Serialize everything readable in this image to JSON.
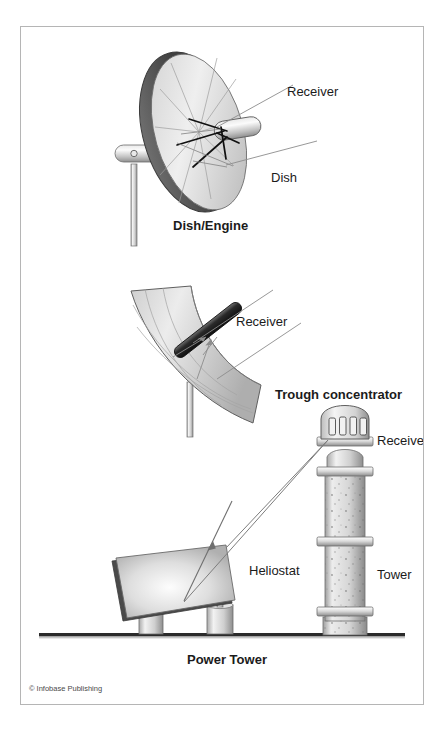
{
  "figure": {
    "copyright": "© Infobase Publishing",
    "colors": {
      "frame_border": "#b5b5b5",
      "background": "#ffffff",
      "text": "#1b1b1b",
      "ray_line": "#8c8c8c",
      "dark_line": "#111111",
      "ground": "#2b2b2b",
      "metal_light": "#f0f0f0",
      "metal_mid": "#b9b9b9",
      "metal_dark": "#6b6b6b",
      "rim_dark": "#4d4d4d"
    }
  },
  "panels": [
    {
      "id": "dish-engine",
      "caption": "Dish/Engine",
      "labels": [
        {
          "id": "receiver",
          "text": "Receiver"
        },
        {
          "id": "dish",
          "text": "Dish"
        }
      ]
    },
    {
      "id": "trough",
      "caption": "Trough concentrator",
      "labels": [
        {
          "id": "receiver",
          "text": "Receiver"
        }
      ]
    },
    {
      "id": "power-tower",
      "caption": "Power Tower",
      "labels": [
        {
          "id": "receiver",
          "text": "Receiver"
        },
        {
          "id": "tower",
          "text": "Tower"
        },
        {
          "id": "heliostat",
          "text": "Heliostat"
        }
      ]
    }
  ]
}
